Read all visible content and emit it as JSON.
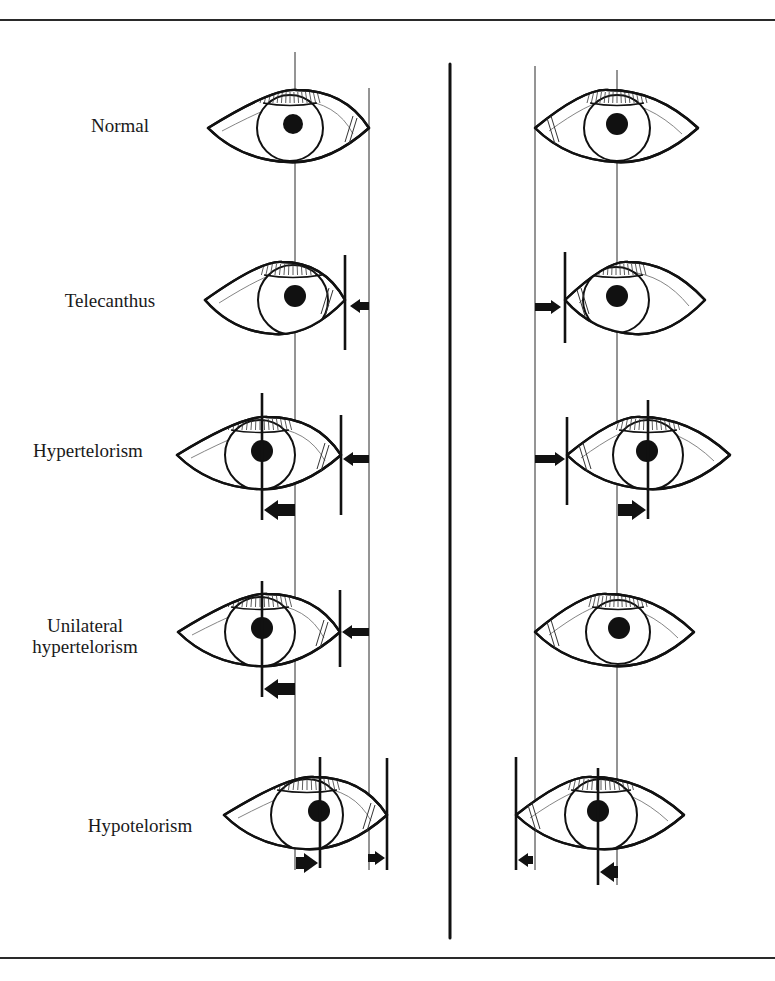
{
  "diagram": {
    "colors": {
      "ink": "#111111",
      "thin_line": "#2a2a2a",
      "background": "#ffffff"
    },
    "frame": {
      "top_rule_y": 19,
      "bottom_rule_y": 957
    },
    "center_divider": {
      "x": 450,
      "y1": 64,
      "y2": 938
    },
    "reference_lines": {
      "left_pupil_x": 295,
      "left_canthus_x": 369,
      "right_canthus_x": 535,
      "right_pupil_x": 617,
      "y_top": 52,
      "y_bottom": 870
    },
    "rows": [
      {
        "id": "normal",
        "label": "Normal",
        "label_pos": {
          "x": 120,
          "y": 115
        },
        "cy": 128,
        "left_eye": {
          "x1": 208,
          "x2": 369,
          "iris_cx": 290,
          "iris_r": 33,
          "pupil_cx": 293,
          "pupil_r": 10
        },
        "right_eye": {
          "x1": 535,
          "x2": 698,
          "iris_cx": 617,
          "iris_r": 33,
          "pupil_cx": 617,
          "pupil_r": 11
        },
        "markers": []
      },
      {
        "id": "telecanthus",
        "label": "Telecanthus",
        "label_pos": {
          "x": 110,
          "y": 290
        },
        "cy": 300,
        "left_eye": {
          "x1": 205,
          "x2": 345,
          "iris_cx": 293,
          "iris_r": 35,
          "pupil_cx": 295,
          "pupil_r": 11
        },
        "right_eye": {
          "x1": 565,
          "x2": 705,
          "iris_cx": 616,
          "iris_r": 33,
          "pupil_cx": 617,
          "pupil_r": 11
        },
        "markers": [
          {
            "type": "bar",
            "x": 345,
            "y1": 255,
            "y2": 350
          },
          {
            "type": "arrow",
            "from_x": 369,
            "to_x": 350,
            "y": 306,
            "size": "small"
          },
          {
            "type": "bar",
            "x": 565,
            "y1": 252,
            "y2": 343
          },
          {
            "type": "arrow",
            "from_x": 535,
            "to_x": 561,
            "y": 307,
            "size": "small"
          }
        ]
      },
      {
        "id": "hypertelorism",
        "label": "Hypertelorism",
        "label_pos": {
          "x": 88,
          "y": 440
        },
        "cy": 455,
        "left_eye": {
          "x1": 177,
          "x2": 341,
          "iris_cx": 260,
          "iris_r": 35,
          "pupil_cx": 262,
          "pupil_r": 11
        },
        "right_eye": {
          "x1": 567,
          "x2": 730,
          "iris_cx": 648,
          "iris_r": 35,
          "pupil_cx": 647,
          "pupil_r": 11
        },
        "markers": [
          {
            "type": "bar",
            "x": 262,
            "y1": 393,
            "y2": 520
          },
          {
            "type": "arrow",
            "from_x": 295,
            "to_x": 264,
            "y": 510,
            "size": "large"
          },
          {
            "type": "bar",
            "x": 341,
            "y1": 415,
            "y2": 515
          },
          {
            "type": "arrow",
            "from_x": 369,
            "to_x": 343,
            "y": 459,
            "size": "small"
          },
          {
            "type": "bar",
            "x": 567,
            "y1": 417,
            "y2": 505
          },
          {
            "type": "arrow",
            "from_x": 535,
            "to_x": 565,
            "y": 459,
            "size": "small"
          },
          {
            "type": "bar",
            "x": 648,
            "y1": 400,
            "y2": 519
          },
          {
            "type": "arrow",
            "from_x": 618,
            "to_x": 646,
            "y": 510,
            "size": "large"
          }
        ]
      },
      {
        "id": "unilateral-hypertelorism",
        "label": "Unilateral\nhypertelorism",
        "label_pos": {
          "x": 85,
          "y": 625
        },
        "cy": 632,
        "left_eye": {
          "x1": 178,
          "x2": 340,
          "iris_cx": 260,
          "iris_r": 35,
          "pupil_cx": 262,
          "pupil_r": 11
        },
        "right_eye": {
          "x1": 535,
          "x2": 694,
          "iris_cx": 618,
          "iris_r": 32,
          "pupil_cx": 619,
          "pupil_r": 11
        },
        "markers": [
          {
            "type": "bar",
            "x": 262,
            "y1": 581,
            "y2": 697
          },
          {
            "type": "arrow",
            "from_x": 295,
            "to_x": 264,
            "y": 689,
            "size": "large"
          },
          {
            "type": "bar",
            "x": 340,
            "y1": 590,
            "y2": 667
          },
          {
            "type": "arrow",
            "from_x": 369,
            "to_x": 342,
            "y": 632,
            "size": "small"
          }
        ]
      },
      {
        "id": "hypotelorism",
        "label": "Hypotelorism",
        "label_pos": {
          "x": 140,
          "y": 815
        },
        "cy": 815,
        "left_eye": {
          "x1": 224,
          "x2": 387,
          "iris_cx": 307,
          "iris_r": 36,
          "pupil_cx": 319,
          "pupil_r": 11
        },
        "right_eye": {
          "x1": 516,
          "x2": 684,
          "iris_cx": 601,
          "iris_r": 36,
          "pupil_cx": 598,
          "pupil_r": 11
        },
        "markers": [
          {
            "type": "bar",
            "x": 320,
            "y1": 757,
            "y2": 868
          },
          {
            "type": "arrow",
            "from_x": 296,
            "to_x": 318,
            "y": 863,
            "size": "large"
          },
          {
            "type": "bar",
            "x": 387,
            "y1": 758,
            "y2": 870
          },
          {
            "type": "arrow",
            "from_x": 368,
            "to_x": 385,
            "y": 858,
            "size": "small"
          },
          {
            "type": "bar",
            "x": 516,
            "y1": 757,
            "y2": 870
          },
          {
            "type": "arrow",
            "from_x": 533,
            "to_x": 518,
            "y": 860,
            "size": "small"
          },
          {
            "type": "bar",
            "x": 598,
            "y1": 768,
            "y2": 885
          },
          {
            "type": "arrow",
            "from_x": 618,
            "to_x": 600,
            "y": 872,
            "size": "large"
          }
        ]
      }
    ]
  }
}
